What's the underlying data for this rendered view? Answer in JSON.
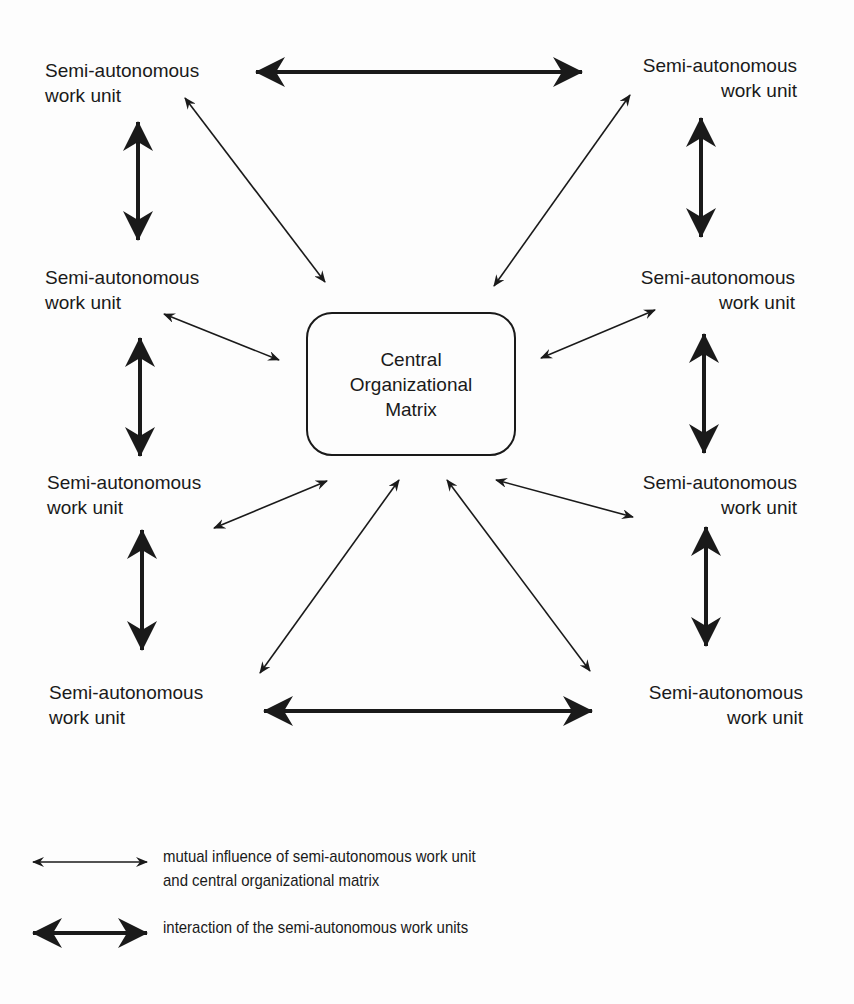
{
  "diagram": {
    "units": [
      {
        "id": "tl",
        "line1": "Semi-autonomous",
        "line2": "work unit"
      },
      {
        "id": "tr",
        "line1": "Semi-autonomous",
        "line2": "work unit"
      },
      {
        "id": "ml1",
        "line1": "Semi-autonomous",
        "line2": "work unit"
      },
      {
        "id": "mr1",
        "line1": "Semi-autonomous",
        "line2": "work unit"
      },
      {
        "id": "ml2",
        "line1": "Semi-autonomous",
        "line2": "work unit"
      },
      {
        "id": "mr2",
        "line1": "Semi-autonomous",
        "line2": "work unit"
      },
      {
        "id": "bl",
        "line1": "Semi-autonomous",
        "line2": "work unit"
      },
      {
        "id": "br",
        "line1": "Semi-autonomous",
        "line2": "work unit"
      }
    ],
    "center": {
      "line1": "Central",
      "line2": "Organizational",
      "line3": "Matrix"
    },
    "legend": {
      "thin": {
        "line1": "mutual influence of semi-autonomous work unit",
        "line2": "and central organizational matrix"
      },
      "thick": {
        "line1": "interaction of the semi-autonomous work units"
      }
    },
    "colors": {
      "ink": "#1a1a1a",
      "background": "#fdfdfd"
    }
  }
}
